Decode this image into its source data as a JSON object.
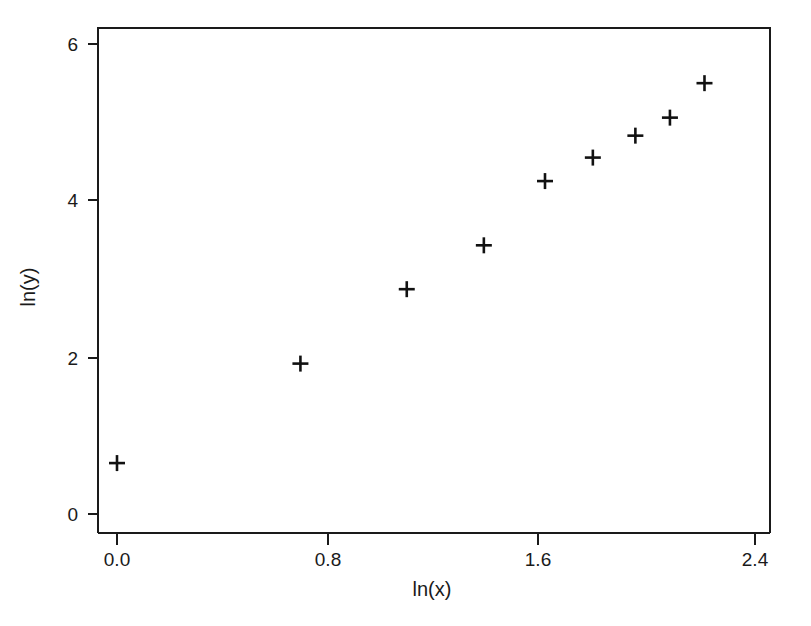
{
  "chart_data": {
    "type": "scatter",
    "title": "",
    "xlabel": "ln(x)",
    "ylabel": "ln(y)",
    "xlim": [
      -0.07,
      2.48
    ],
    "ylim": [
      -0.24,
      6.18
    ],
    "xticks": [
      0.0,
      0.8,
      1.6,
      2.4
    ],
    "xticklabels": [
      "0.0",
      "0.8",
      "1.6",
      "2.4"
    ],
    "yticks": [
      0,
      2,
      4,
      6
    ],
    "yticklabels": [
      "0",
      "2",
      "4",
      "6"
    ],
    "grid": false,
    "legend": null,
    "marker": "plus",
    "marker_color": "#111111",
    "series": [
      {
        "name": "observations",
        "marker": "plus",
        "points": [
          {
            "x": 0.0,
            "y": 0.65
          },
          {
            "x": 0.69,
            "y": 1.92
          },
          {
            "x": 1.09,
            "y": 2.87
          },
          {
            "x": 1.38,
            "y": 3.43
          },
          {
            "x": 1.61,
            "y": 4.25
          },
          {
            "x": 1.79,
            "y": 4.55
          },
          {
            "x": 1.95,
            "y": 4.83
          },
          {
            "x": 2.08,
            "y": 5.06
          },
          {
            "x": 2.21,
            "y": 5.5
          }
        ]
      }
    ]
  },
  "axis_titles": {
    "x": "ln(x)",
    "y": "ln(y)"
  }
}
